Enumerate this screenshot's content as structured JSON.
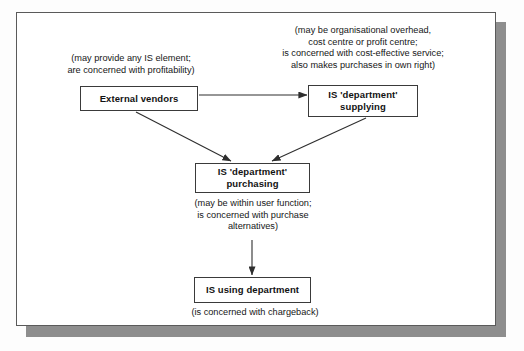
{
  "diagram": {
    "nodes": [
      {
        "id": "external-vendors",
        "label": "External vendors"
      },
      {
        "id": "is-supplying",
        "label": "IS 'department'\nsupplying"
      },
      {
        "id": "is-purchasing",
        "label": "IS 'department'\npurchasing"
      },
      {
        "id": "is-using",
        "label": "IS using department"
      }
    ],
    "notes": [
      {
        "id": "note-vendors",
        "for": "external-vendors",
        "text": "(may provide any IS element;\nare concerned with profitability)"
      },
      {
        "id": "note-supplying",
        "for": "is-supplying",
        "text": "(may be organisational overhead,\ncost centre or profit centre;\nis concerned with cost-effective service;\nalso makes purchases in own right)"
      },
      {
        "id": "note-purchasing",
        "for": "is-purchasing",
        "text": "(may be within user function;\nis concerned with purchase\nalternatives)"
      },
      {
        "id": "note-using",
        "for": "is-using",
        "text": "(is concerned with chargeback)"
      }
    ],
    "edges": [
      {
        "id": "edge-vendors-to-supplying",
        "from": "external-vendors",
        "to": "is-supplying",
        "style": "horizontal-arrow"
      },
      {
        "id": "edge-vendors-to-purchasing",
        "from": "external-vendors",
        "to": "is-purchasing",
        "style": "diagonal-arrow"
      },
      {
        "id": "edge-supplying-to-purchasing",
        "from": "is-supplying",
        "to": "is-purchasing",
        "style": "diagonal-arrow"
      },
      {
        "id": "edge-purchasing-to-using",
        "from": "is-purchasing",
        "to": "is-using",
        "style": "vertical-arrow"
      }
    ],
    "colors": {
      "box_border": "#3a3a3a",
      "frame_border": "#5a5a5a",
      "shadow": "#8e8e8e",
      "line": "#3a3a3a",
      "text": "#121212",
      "background": "#ffffff"
    }
  }
}
